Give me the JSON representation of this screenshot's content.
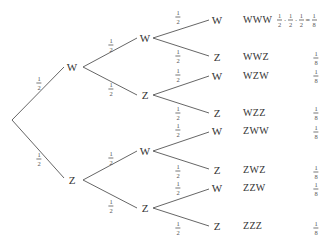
{
  "diagram": {
    "type": "probability-tree",
    "root": {
      "branches": [
        {
          "label": "W",
          "prob": {
            "num": "1",
            "den": "2"
          },
          "branches": [
            {
              "label": "W",
              "prob": {
                "num": "1",
                "den": "2"
              },
              "branches": [
                {
                  "label": "W",
                  "prob": {
                    "num": "1",
                    "den": "2"
                  },
                  "outcome": "WWW"
                },
                {
                  "label": "Z",
                  "prob": {
                    "num": "1",
                    "den": "2"
                  },
                  "outcome": "WWZ"
                }
              ]
            },
            {
              "label": "Z",
              "prob": {
                "num": "1",
                "den": "2"
              },
              "branches": [
                {
                  "label": "W",
                  "prob": {
                    "num": "1",
                    "den": "2"
                  },
                  "outcome": "WZW"
                },
                {
                  "label": "Z",
                  "prob": {
                    "num": "1",
                    "den": "2"
                  },
                  "outcome": "WZZ"
                }
              ]
            }
          ]
        },
        {
          "label": "Z",
          "prob": {
            "num": "1",
            "den": "2"
          },
          "branches": [
            {
              "label": "W",
              "prob": {
                "num": "1",
                "den": "2"
              },
              "branches": [
                {
                  "label": "W",
                  "prob": {
                    "num": "1",
                    "den": "2"
                  },
                  "outcome": "ZWW"
                },
                {
                  "label": "Z",
                  "prob": {
                    "num": "1",
                    "den": "2"
                  },
                  "outcome": "ZWZ"
                }
              ]
            },
            {
              "label": "Z",
              "prob": {
                "num": "1",
                "den": "2"
              },
              "branches": [
                {
                  "label": "W",
                  "prob": {
                    "num": "1",
                    "den": "2"
                  },
                  "outcome": "ZZW"
                },
                {
                  "label": "Z",
                  "prob": {
                    "num": "1",
                    "den": "2"
                  },
                  "outcome": "ZZZ"
                }
              ]
            }
          ]
        }
      ]
    },
    "outcomes": [
      {
        "sequence": "WWW",
        "probability": {
          "num": "1",
          "den": "8"
        }
      },
      {
        "sequence": "WWZ",
        "probability": {
          "num": "1",
          "den": "8"
        }
      },
      {
        "sequence": "WZW",
        "probability": {
          "num": "1",
          "den": "8"
        }
      },
      {
        "sequence": "WZZ",
        "probability": {
          "num": "1",
          "den": "8"
        }
      },
      {
        "sequence": "ZWW",
        "probability": {
          "num": "1",
          "den": "8"
        }
      },
      {
        "sequence": "ZWZ",
        "probability": {
          "num": "1",
          "den": "8"
        }
      },
      {
        "sequence": "ZZW",
        "probability": {
          "num": "1",
          "den": "8"
        }
      },
      {
        "sequence": "ZZZ",
        "probability": {
          "num": "1",
          "den": "8"
        }
      }
    ],
    "first_product": {
      "factors": [
        {
          "num": "1",
          "den": "2"
        },
        {
          "num": "1",
          "den": "2"
        },
        {
          "num": "1",
          "den": "2"
        }
      ],
      "dot": "·",
      "equals": "=",
      "result": {
        "num": "1",
        "den": "8"
      }
    }
  }
}
